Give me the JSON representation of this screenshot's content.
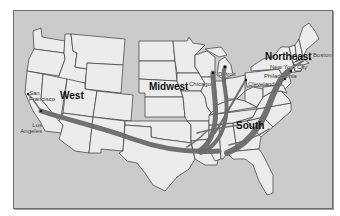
{
  "map": {
    "type": "thematic-map",
    "subject": "United States regions with migration routes",
    "colors": {
      "background": "#cbcbcb",
      "land": "#ececec",
      "borders": "#3a3a3a",
      "routes": "#6a6a6a"
    },
    "regions": [
      {
        "id": "west",
        "label": "West"
      },
      {
        "id": "midwest",
        "label": "Midwest"
      },
      {
        "id": "northeast",
        "label": "Northeast"
      },
      {
        "id": "south",
        "label": "South"
      }
    ],
    "cities": [
      {
        "id": "san-francisco",
        "label_line1": "San",
        "label_line2": "Francisco"
      },
      {
        "id": "los-angeles",
        "label_line1": "Los",
        "label_line2": "Angeles"
      },
      {
        "id": "chicago",
        "label": "Chicago"
      },
      {
        "id": "detroit",
        "label": "Detroit"
      },
      {
        "id": "cleveland",
        "label": "Cleveland"
      },
      {
        "id": "philadelphia",
        "label": "Philadelphia"
      },
      {
        "id": "new-york-city",
        "label": "New York City"
      },
      {
        "id": "boston",
        "label": "Boston"
      }
    ],
    "routes": [
      {
        "from": "South",
        "to": "Los Angeles / San Francisco"
      },
      {
        "from": "South",
        "to": "Chicago"
      },
      {
        "from": "South",
        "to": "Detroit / Cleveland"
      },
      {
        "from": "South",
        "to": "Philadelphia / New York City / Boston"
      }
    ]
  }
}
